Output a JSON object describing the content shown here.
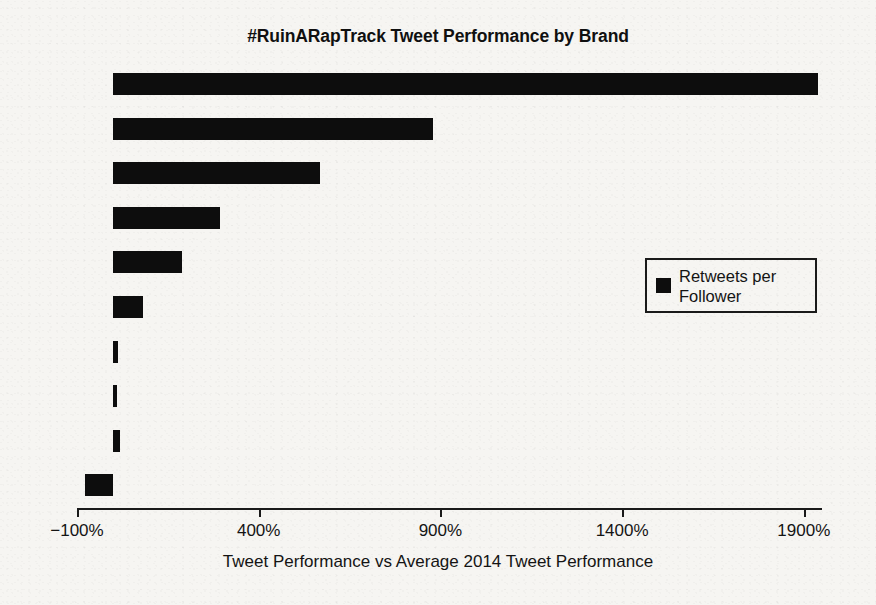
{
  "chart_data": {
    "type": "bar",
    "orientation": "horizontal",
    "title": "#RuinARapTrack Tweet Performance by Brand",
    "xlabel": "Tweet Performance vs Average 2014 Tweet Performance",
    "ylabel": "",
    "xlim": [
      -100,
      1950
    ],
    "xticks": [
      -100,
      400,
      900,
      1400,
      1900
    ],
    "xtick_labels": [
      "−100%",
      "400%",
      "900%",
      "1400%",
      "1900%"
    ],
    "ytick_labels": [
      "",
      "",
      "",
      "",
      "",
      "",
      "",
      "",
      "",
      ""
    ],
    "grid": false,
    "legend": {
      "position": "center-right",
      "entries": [
        {
          "name": "Retweets per\nFollower",
          "color": "#0d0d0d"
        }
      ]
    },
    "series": [
      {
        "name": "Retweets per Follower",
        "color": "#0d0d0d",
        "values": [
          1940,
          880,
          570,
          293,
          190,
          83,
          14,
          11,
          19,
          -77
        ]
      }
    ],
    "bar_color": "#0d0d0d",
    "background_color": "#f6f5f2",
    "axis_color": "#1a1a1a"
  }
}
